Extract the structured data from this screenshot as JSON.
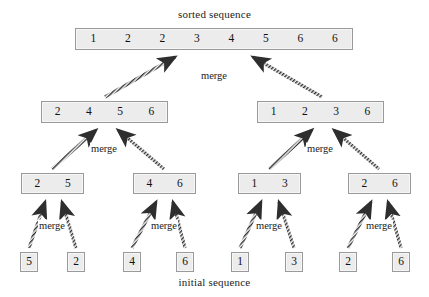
{
  "captions": {
    "top": "sorted sequence",
    "bottom": "initial sequence",
    "merge": "merge"
  },
  "colors": {
    "box_fill": "#ececec",
    "box_border": "#9a9a9a",
    "arrow": "#3a3a3a",
    "text": "#111111",
    "background": "#ffffff"
  },
  "chart_data": {
    "type": "diagram",
    "title": "sorted sequence",
    "subtitle": "initial sequence",
    "operation": "merge",
    "levels": [
      {
        "level": 0,
        "name": "sorted-sequence",
        "boxes": [
          {
            "id": "L0B0",
            "values": [
              "1",
              "2",
              "2",
              "3",
              "4",
              "5",
              "6",
              "6"
            ],
            "x": 75,
            "y": 28,
            "w": 278,
            "h": 22
          }
        ]
      },
      {
        "level": 1,
        "name": "merged-halves",
        "boxes": [
          {
            "id": "L1B0",
            "values": [
              "2",
              "4",
              "5",
              "6"
            ],
            "x": 41,
            "y": 101,
            "w": 127,
            "h": 22
          },
          {
            "id": "L1B1",
            "values": [
              "1",
              "2",
              "3",
              "6"
            ],
            "x": 257,
            "y": 101,
            "w": 127,
            "h": 22
          }
        ]
      },
      {
        "level": 2,
        "name": "merged-pairs",
        "boxes": [
          {
            "id": "L2B0",
            "values": [
              "2",
              "5"
            ],
            "x": 21,
            "y": 173,
            "w": 63,
            "h": 21
          },
          {
            "id": "L2B1",
            "values": [
              "4",
              "6"
            ],
            "x": 133,
            "y": 173,
            "w": 63,
            "h": 21
          },
          {
            "id": "L2B2",
            "values": [
              "1",
              "3"
            ],
            "x": 238,
            "y": 173,
            "w": 63,
            "h": 21
          },
          {
            "id": "L2B3",
            "values": [
              "2",
              "6"
            ],
            "x": 348,
            "y": 173,
            "w": 63,
            "h": 21
          }
        ]
      },
      {
        "level": 3,
        "name": "initial-sequence",
        "boxes": [
          {
            "id": "L3B0",
            "values": [
              "5"
            ],
            "x": 20,
            "y": 252,
            "w": 18,
            "h": 20
          },
          {
            "id": "L3B1",
            "values": [
              "2"
            ],
            "x": 67,
            "y": 252,
            "w": 18,
            "h": 20
          },
          {
            "id": "L3B2",
            "values": [
              "4"
            ],
            "x": 123,
            "y": 252,
            "w": 18,
            "h": 20
          },
          {
            "id": "L3B3",
            "values": [
              "6"
            ],
            "x": 176,
            "y": 252,
            "w": 18,
            "h": 20
          },
          {
            "id": "L3B4",
            "values": [
              "1"
            ],
            "x": 231,
            "y": 252,
            "w": 18,
            "h": 20
          },
          {
            "id": "L3B5",
            "values": [
              "3"
            ],
            "x": 285,
            "y": 252,
            "w": 18,
            "h": 20
          },
          {
            "id": "L3B6",
            "values": [
              "2"
            ],
            "x": 339,
            "y": 252,
            "w": 18,
            "h": 20
          },
          {
            "id": "L3B7",
            "values": [
              "6"
            ],
            "x": 392,
            "y": 252,
            "w": 18,
            "h": 20
          }
        ]
      }
    ],
    "merge_labels": [
      {
        "id": "M0",
        "text": "merge",
        "x": 214,
        "y": 75
      },
      {
        "id": "M1",
        "text": "merge",
        "x": 104,
        "y": 148
      },
      {
        "id": "M2",
        "text": "merge",
        "x": 320,
        "y": 148
      },
      {
        "id": "M3",
        "text": "merge",
        "x": 52,
        "y": 225
      },
      {
        "id": "M4",
        "text": "merge",
        "x": 164,
        "y": 225
      },
      {
        "id": "M5",
        "text": "merge",
        "x": 269,
        "y": 225
      },
      {
        "id": "M6",
        "text": "merge",
        "x": 379,
        "y": 225
      }
    ],
    "arrows": [
      {
        "id": "A0",
        "from": [
          105,
          97
        ],
        "to": [
          175,
          57
        ]
      },
      {
        "id": "A1",
        "from": [
          322,
          97
        ],
        "to": [
          253,
          57
        ]
      },
      {
        "id": "A2",
        "from": [
          52,
          169
        ],
        "to": [
          96,
          130
        ]
      },
      {
        "id": "A3",
        "from": [
          164,
          169
        ],
        "to": [
          118,
          130
        ]
      },
      {
        "id": "A4",
        "from": [
          269,
          169
        ],
        "to": [
          312,
          130
        ]
      },
      {
        "id": "A5",
        "from": [
          379,
          169
        ],
        "to": [
          334,
          130
        ]
      },
      {
        "id": "A6",
        "from": [
          29,
          248
        ],
        "to": [
          45,
          202
        ]
      },
      {
        "id": "A7",
        "from": [
          76,
          248
        ],
        "to": [
          62,
          202
        ]
      },
      {
        "id": "A8",
        "from": [
          132,
          248
        ],
        "to": [
          156,
          202
        ]
      },
      {
        "id": "A9",
        "from": [
          185,
          248
        ],
        "to": [
          173,
          202
        ]
      },
      {
        "id": "A10",
        "from": [
          240,
          248
        ],
        "to": [
          261,
          202
        ]
      },
      {
        "id": "A11",
        "from": [
          294,
          248
        ],
        "to": [
          279,
          202
        ]
      },
      {
        "id": "A12",
        "from": [
          348,
          248
        ],
        "to": [
          371,
          202
        ]
      },
      {
        "id": "A13",
        "from": [
          401,
          248
        ],
        "to": [
          388,
          202
        ]
      }
    ],
    "xlabel": "",
    "ylabel": "",
    "grid": false,
    "legend": "none"
  }
}
